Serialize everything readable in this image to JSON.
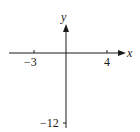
{
  "diagram": {
    "type": "coordinate-axes",
    "x_axis": {
      "label": "x",
      "ticks": [
        {
          "value": -3,
          "label": "−3"
        },
        {
          "value": 4,
          "label": "4"
        }
      ]
    },
    "y_axis": {
      "label": "y",
      "ticks": [
        {
          "value": -12,
          "label": "−12"
        }
      ]
    },
    "colors": {
      "axis": "#1a1a1a",
      "background": "#ffffff"
    }
  }
}
